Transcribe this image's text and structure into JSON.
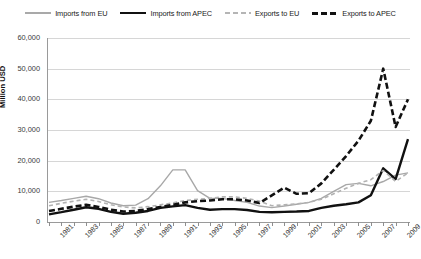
{
  "chart_data": {
    "type": "line",
    "title": "",
    "xlabel": "",
    "ylabel": "Million USD",
    "ylim": [
      0,
      60000
    ],
    "ytick_labels": [
      "0",
      "10,000",
      "20,000",
      "30,000",
      "40,000",
      "50,000",
      "60,000"
    ],
    "ytick_values": [
      0,
      10000,
      20000,
      30000,
      40000,
      50000,
      60000
    ],
    "grid": true,
    "legend_position": "top",
    "x": [
      1981,
      1982,
      1983,
      1984,
      1985,
      1986,
      1987,
      1988,
      1989,
      1990,
      1991,
      1992,
      1993,
      1994,
      1995,
      1996,
      1997,
      1998,
      1999,
      2000,
      2001,
      2002,
      2003,
      2004,
      2005,
      2006,
      2007,
      2008,
      2009,
      2010
    ],
    "xtick_labels": [
      "1981",
      "1983",
      "1985",
      "1987",
      "1989",
      "1991",
      "1993",
      "1995",
      "1997",
      "1999",
      "2001",
      "2003",
      "2005",
      "2007",
      "2009"
    ],
    "series": [
      {
        "name": "Imports from EU",
        "color": "#a8a8a8",
        "style": "solid",
        "width": 1.4,
        "values": [
          6400,
          7000,
          7700,
          8400,
          7600,
          6200,
          5300,
          5500,
          7600,
          11800,
          17000,
          17000,
          10200,
          7700,
          7700,
          7000,
          6400,
          5200,
          4700,
          5200,
          5800,
          6400,
          7700,
          10000,
          12200,
          12600,
          11800,
          13200,
          15300,
          16000
        ]
      },
      {
        "name": "Imports from APEC",
        "color": "#111111",
        "style": "solid",
        "width": 2.4,
        "values": [
          2500,
          3200,
          4000,
          4800,
          4300,
          3300,
          2700,
          3000,
          3600,
          4600,
          5100,
          5500,
          4600,
          4000,
          4200,
          4200,
          3900,
          3300,
          3200,
          3300,
          3400,
          3600,
          4600,
          5300,
          5800,
          6400,
          8700,
          17500,
          14000,
          27000
        ]
      },
      {
        "name": "Exports to EU",
        "color": "#b2b2b2",
        "style": "dashed",
        "width": 1.6,
        "values": [
          5300,
          6100,
          6800,
          7400,
          6700,
          5600,
          4900,
          4600,
          5000,
          5600,
          6200,
          7000,
          7400,
          7700,
          8200,
          8200,
          7700,
          6800,
          5300,
          5600,
          5900,
          6400,
          7400,
          9200,
          11000,
          12600,
          13800,
          16800,
          13200,
          16000
        ]
      },
      {
        "name": "Exports to APEC",
        "color": "#111111",
        "style": "dashed",
        "width": 2.6,
        "values": [
          3600,
          4300,
          5000,
          5600,
          4900,
          4000,
          3400,
          3600,
          4200,
          4900,
          5600,
          6400,
          6800,
          7000,
          7400,
          7400,
          7000,
          6200,
          8700,
          11200,
          9200,
          9400,
          12600,
          17000,
          21500,
          26500,
          33000,
          50000,
          31000,
          40000
        ]
      }
    ]
  },
  "legend": {
    "items": [
      {
        "label": "Imports from EU"
      },
      {
        "label": "Imports from APEC"
      },
      {
        "label": "Exports to EU"
      },
      {
        "label": "Exports to APEC"
      }
    ]
  }
}
